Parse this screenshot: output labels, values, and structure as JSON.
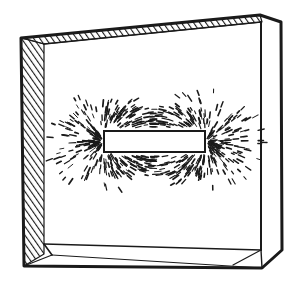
{
  "figure": {
    "colors": {
      "ink": "#1a1a1a",
      "paper": "#ffffff"
    },
    "parts": {
      "box": "glass-box",
      "magnet": "bar-magnet",
      "filings": "iron-filings-field-pattern"
    }
  }
}
